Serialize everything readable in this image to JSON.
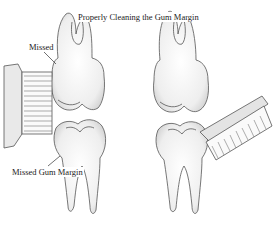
{
  "diagram": {
    "title": "Properly Cleaning the Gum Margin",
    "labels": {
      "missed": "Missed",
      "missed_gum_margin": "Missed Gum Margin"
    },
    "panels": [
      {
        "name": "incorrect-technique",
        "side": "left",
        "brush_angle": "straight"
      },
      {
        "name": "correct-technique",
        "side": "right",
        "brush_angle": "angled"
      }
    ],
    "colors": {
      "line": "#555555",
      "shade": "#cfcfcf",
      "background": "#ffffff"
    }
  }
}
